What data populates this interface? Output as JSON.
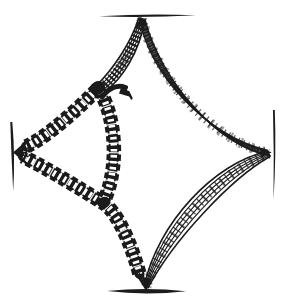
{
  "figure": {
    "type": "engraved line illustration (no text)",
    "background": "plain white paper"
  },
  "colors": {
    "ink": "#1b1b1b",
    "paper": "#ffffff"
  },
  "components": [
    {
      "name": "top-bar",
      "label": "Top holding bar"
    },
    {
      "name": "bottom-bar",
      "label": "Bottom holding bar"
    },
    {
      "name": "left-bar",
      "label": "Left holding bar"
    },
    {
      "name": "right-bar",
      "label": "Right holding bar"
    },
    {
      "name": "top-right-string-bundle",
      "label": "Thread bundle curving from top bar to right bar"
    },
    {
      "name": "bottom-right-string-bundle",
      "label": "Thread bundle curving from right bar to bottom bar"
    },
    {
      "name": "apex-rope-bundle",
      "label": "Dense twisted rope from top bar down to the braid junction"
    },
    {
      "name": "upper-left-braided-cord",
      "label": "Braided cord from junction down-left to left bar"
    },
    {
      "name": "lower-left-braided-cord",
      "label": "Braided cord from left bar through lower crossing to bottom bar"
    },
    {
      "name": "middle-vertical-braided-cord",
      "label": "Bowed braided cord from junction down to lower crossing"
    },
    {
      "name": "top-junction-knot",
      "label": "Knot where rope and braids meet"
    },
    {
      "name": "lower-crossing-knot",
      "label": "Knot where braids cross"
    },
    {
      "name": "braid-hook-curl",
      "label": "Small curled hook at top of middle cord"
    }
  ]
}
